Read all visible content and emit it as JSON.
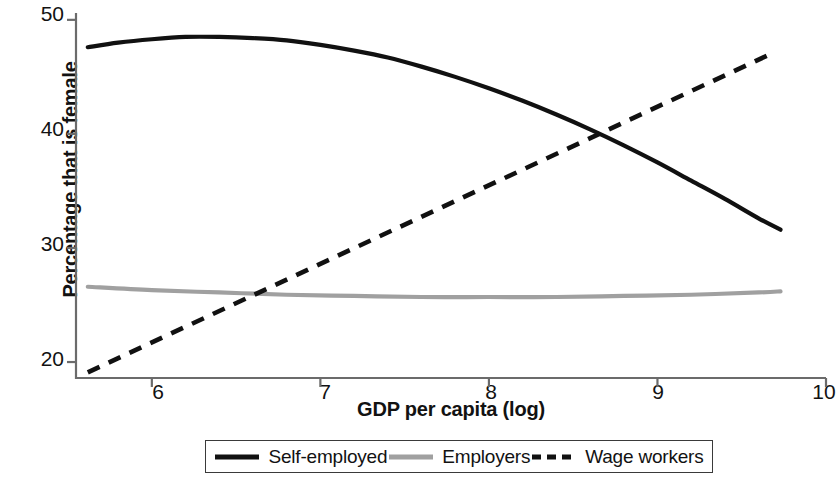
{
  "chart_data": {
    "type": "line",
    "title": "",
    "subtitle": "",
    "xlabel": "GDP per capita (log)",
    "ylabel": "Percentage that is female",
    "xlim": [
      5.55,
      10.0
    ],
    "ylim": [
      18.6,
      50.6
    ],
    "xticks": [
      6,
      7,
      8,
      9,
      10
    ],
    "xtick_labels": [
      "6",
      "7",
      "8",
      "9",
      "10"
    ],
    "yticks": [
      20,
      30,
      40,
      50
    ],
    "ytick_labels": [
      "20",
      "30",
      "40",
      "50"
    ],
    "grid": false,
    "legend_position": "bottom",
    "series": [
      {
        "name": "Self-employed",
        "style": "solid",
        "color": "#111111",
        "width": 4.2,
        "x": [
          5.62,
          5.8,
          6.0,
          6.2,
          6.4,
          6.6,
          6.8,
          7.0,
          7.2,
          7.4,
          7.6,
          7.8,
          8.0,
          8.2,
          8.4,
          8.6,
          8.8,
          9.0,
          9.2,
          9.4,
          9.6,
          9.73
        ],
        "y": [
          47.6,
          48.0,
          48.3,
          48.5,
          48.5,
          48.4,
          48.2,
          47.8,
          47.3,
          46.7,
          45.9,
          45.0,
          44.0,
          42.9,
          41.7,
          40.4,
          39.0,
          37.5,
          35.9,
          34.3,
          32.6,
          31.6
        ]
      },
      {
        "name": "Employers",
        "style": "solid",
        "color": "#a0a0a0",
        "width": 4.2,
        "x": [
          5.62,
          6.0,
          6.4,
          6.8,
          7.2,
          7.6,
          8.0,
          8.4,
          8.8,
          9.2,
          9.6,
          9.73
        ],
        "y": [
          26.6,
          26.3,
          26.1,
          25.9,
          25.8,
          25.7,
          25.7,
          25.7,
          25.8,
          25.9,
          26.1,
          26.2
        ]
      },
      {
        "name": "Wage workers",
        "style": "dashed",
        "color": "#111111",
        "width": 4.6,
        "x": [
          5.62,
          9.7
        ],
        "y": [
          19.1,
          47.2
        ]
      }
    ],
    "annotations": [
      {
        "label": "self-employed crosses wage workers",
        "x": 8.73,
        "y": 40.1
      },
      {
        "label": "employers crosses wage workers",
        "x": 6.68,
        "y": 25.9
      }
    ]
  },
  "legend": {
    "items": [
      {
        "label": "Self-employed",
        "swatch": "solid-black-line-icon"
      },
      {
        "label": "Employers",
        "swatch": "solid-gray-line-icon"
      },
      {
        "label": "Wage workers",
        "swatch": "dashed-black-line-icon"
      }
    ]
  }
}
